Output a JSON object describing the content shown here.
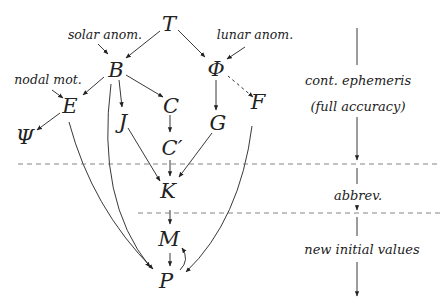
{
  "diagram": {
    "nodes": {
      "T": "T",
      "B": "B",
      "Phi": "Φ",
      "E": "E",
      "C": "C",
      "J": "J",
      "G": "G",
      "F": "F",
      "Psi": "Ψ",
      "C_prime": "C′",
      "K": "K",
      "M": "M",
      "P": "P"
    },
    "labels": {
      "solar_anom": "solar anom.",
      "lunar_anom": "lunar anom.",
      "nodal_mot": "nodal mot."
    },
    "edges": [
      {
        "from": "T",
        "to": "B"
      },
      {
        "from": "T",
        "to": "Φ"
      },
      {
        "from": "solar anom.",
        "to": "B"
      },
      {
        "from": "lunar anom.",
        "to": "Φ"
      },
      {
        "from": "nodal mot.",
        "to": "E"
      },
      {
        "from": "B",
        "to": "E"
      },
      {
        "from": "B",
        "to": "J"
      },
      {
        "from": "B",
        "to": "C"
      },
      {
        "from": "B",
        "to": "P"
      },
      {
        "from": "E",
        "to": "Ψ"
      },
      {
        "from": "E",
        "to": "P"
      },
      {
        "from": "C",
        "to": "C′"
      },
      {
        "from": "C′",
        "to": "K"
      },
      {
        "from": "J",
        "to": "K"
      },
      {
        "from": "Φ",
        "to": "G"
      },
      {
        "from": "F",
        "to": "Φ",
        "style": "dashed"
      },
      {
        "from": "G",
        "to": "K"
      },
      {
        "from": "F",
        "to": "P"
      },
      {
        "from": "K",
        "to": "M"
      },
      {
        "from": "M",
        "to": "P"
      },
      {
        "from": "P",
        "to": "M",
        "style": "curved"
      }
    ]
  },
  "phases": {
    "stage1_line1": "cont. ephemeris",
    "stage1_line2": "(full accuracy)",
    "stage2": "abbrev.",
    "stage3": "new initial values"
  },
  "colors": {
    "ink": "#222222",
    "dashed": "#666666",
    "background": "#ffffff"
  }
}
